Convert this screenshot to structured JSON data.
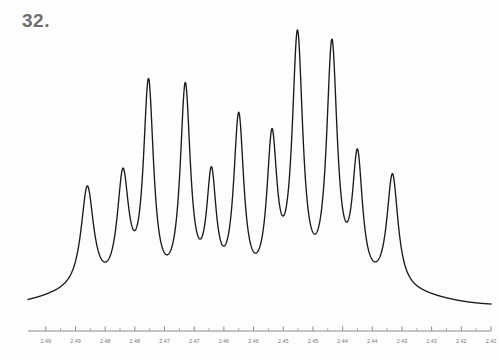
{
  "figure": {
    "number_label": "32.",
    "label_color": "#6e6e6e",
    "background_color": "#fdfdfd",
    "trace_color": "#1a1a1a",
    "axis_color": "#8a8a8a"
  },
  "chart_data": {
    "type": "line",
    "title": "",
    "subtitle": "",
    "xlabel": "",
    "ylabel": "",
    "grid": false,
    "legend": null,
    "x_axis_direction": "decreasing",
    "xlim": [
      2.4955,
      2.4175
    ],
    "ylim": [
      0,
      1
    ],
    "tick_labels": [
      "2.49",
      "2.49",
      "2.48",
      "2.48",
      "2.47",
      "2.47",
      "2.46",
      "2.46",
      "2.45",
      "2.45",
      "2.44",
      "2.44",
      "2.43",
      "2.43",
      "2.42",
      "2.42"
    ],
    "tick_values": [
      2.4925,
      2.4875,
      2.4825,
      2.4775,
      2.4725,
      2.4675,
      2.4625,
      2.4575,
      2.4525,
      2.4475,
      2.4425,
      2.4375,
      2.4325,
      2.4275,
      2.4225,
      2.4175
    ],
    "minor_ticks_between_majors": 1,
    "baseline_level": 0.03,
    "peaks": [
      {
        "index": 1,
        "ppm": 2.4855,
        "height": 0.37,
        "width": 0.0026
      },
      {
        "index": 2,
        "ppm": 2.4795,
        "height": 0.41,
        "width": 0.0024
      },
      {
        "index": 3,
        "ppm": 2.4752,
        "height": 0.74,
        "width": 0.0021
      },
      {
        "index": 4,
        "ppm": 2.469,
        "height": 0.73,
        "width": 0.0021
      },
      {
        "index": 5,
        "ppm": 2.4646,
        "height": 0.4,
        "width": 0.002
      },
      {
        "index": 6,
        "ppm": 2.46,
        "height": 0.62,
        "width": 0.0021
      },
      {
        "index": 7,
        "ppm": 2.4544,
        "height": 0.53,
        "width": 0.0021
      },
      {
        "index": 8,
        "ppm": 2.4501,
        "height": 0.9,
        "width": 0.0022
      },
      {
        "index": 9,
        "ppm": 2.4443,
        "height": 0.87,
        "width": 0.0022
      },
      {
        "index": 10,
        "ppm": 2.44,
        "height": 0.46,
        "width": 0.0021
      },
      {
        "index": 11,
        "ppm": 2.4341,
        "height": 0.41,
        "width": 0.0023
      }
    ],
    "series": [
      {
        "name": "multiplet",
        "x": [
          2.4955,
          2.494,
          2.492,
          2.49,
          2.488,
          2.486,
          2.484,
          2.482,
          2.48,
          2.478,
          2.476,
          2.474,
          2.472,
          2.47,
          2.468,
          2.466,
          2.464,
          2.462,
          2.46,
          2.458,
          2.456,
          2.454,
          2.452,
          2.45,
          2.448,
          2.446,
          2.444,
          2.442,
          2.44,
          2.438,
          2.436,
          2.434,
          2.432,
          2.43,
          2.428,
          2.424,
          2.42,
          2.4175
        ],
        "y": [
          0.03,
          0.04,
          0.05,
          0.08,
          0.22,
          0.36,
          0.2,
          0.14,
          0.4,
          0.22,
          0.45,
          0.73,
          0.3,
          0.72,
          0.27,
          0.32,
          0.39,
          0.23,
          0.61,
          0.25,
          0.33,
          0.52,
          0.3,
          0.89,
          0.33,
          0.55,
          0.86,
          0.3,
          0.45,
          0.22,
          0.2,
          0.4,
          0.19,
          0.1,
          0.06,
          0.04,
          0.035,
          0.035
        ]
      }
    ]
  }
}
